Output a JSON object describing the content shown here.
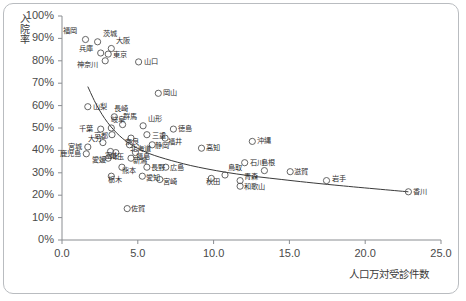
{
  "chart_data": {
    "type": "scatter",
    "title": "",
    "xlabel": "人口万対受診件数",
    "ylabel": "入院率",
    "xlim": [
      0,
      25
    ],
    "ylim": [
      0,
      1.0
    ],
    "xticks": [
      "0.0",
      "5.0",
      "10.0",
      "15.0",
      "20.0",
      "25.0"
    ],
    "xtick_values": [
      0,
      5,
      10,
      15,
      20,
      25
    ],
    "yticks": [
      "0%",
      "10%",
      "20%",
      "30%",
      "40%",
      "50%",
      "60%",
      "70%",
      "80%",
      "90%",
      "100%"
    ],
    "ytick_values": [
      0,
      10,
      20,
      30,
      40,
      50,
      60,
      70,
      80,
      90,
      100
    ],
    "grid": false,
    "legend": "none",
    "marker": "open-circle",
    "marker_color": "#555555",
    "trendline_color": "#3a3a3a",
    "points": [
      {
        "label": "福岡",
        "x": 1.55,
        "y": 89.5,
        "lx": -22,
        "ly": -9
      },
      {
        "label": "茨城",
        "x": 2.35,
        "y": 88.5,
        "lx": 5,
        "ly": -8
      },
      {
        "label": "大阪",
        "x": 3.25,
        "y": 85.5,
        "lx": 5,
        "ly": -7
      },
      {
        "label": "兵庫",
        "x": 2.55,
        "y": 83.5,
        "lx": -22,
        "ly": -4
      },
      {
        "label": "東京",
        "x": 3.05,
        "y": 83.0,
        "lx": 5,
        "ly": 1
      },
      {
        "label": "神奈川",
        "x": 2.85,
        "y": 80.0,
        "lx": -28,
        "ly": 4
      },
      {
        "label": "山口",
        "x": 5.05,
        "y": 79.5,
        "lx": 5,
        "ly": 0
      },
      {
        "label": "岡山",
        "x": 6.35,
        "y": 65.5,
        "lx": 5,
        "ly": 0
      },
      {
        "label": "山梨",
        "x": 1.7,
        "y": 59.5,
        "lx": 5,
        "ly": 0
      },
      {
        "label": "長崎",
        "x": 3.45,
        "y": 55.0,
        "lx": 0,
        "ly": -8
      },
      {
        "label": "群馬",
        "x": 4.0,
        "y": 51.5,
        "lx": 0,
        "ly": -8
      },
      {
        "label": "山形",
        "x": 5.35,
        "y": 51.0,
        "lx": 5,
        "ly": -7
      },
      {
        "label": "千葉",
        "x": 2.55,
        "y": 49.5,
        "lx": -22,
        "ly": 0
      },
      {
        "label": "岐阜",
        "x": 3.25,
        "y": 50.0,
        "lx": 0,
        "ly": -8
      },
      {
        "label": "徳島",
        "x": 7.35,
        "y": 49.5,
        "lx": 5,
        "ly": 0
      },
      {
        "label": "京都",
        "x": 3.3,
        "y": 47.0,
        "lx": -18,
        "ly": 1
      },
      {
        "label": "三重",
        "x": 5.6,
        "y": 47.0,
        "lx": 5,
        "ly": 1
      },
      {
        "label": "奈良",
        "x": 4.55,
        "y": 45.5,
        "lx": -6,
        "ly": 4
      },
      {
        "label": "福井",
        "x": 6.8,
        "y": 45.5,
        "lx": 3,
        "ly": 4
      },
      {
        "label": "大分",
        "x": 2.7,
        "y": 43.5,
        "lx": -15,
        "ly": -4
      },
      {
        "label": "北海道",
        "x": 4.45,
        "y": 42.5,
        "lx": 1,
        "ly": 4
      },
      {
        "label": "静岡",
        "x": 5.95,
        "y": 42.5,
        "lx": 3,
        "ly": 1
      },
      {
        "label": "宮城",
        "x": 1.7,
        "y": 41.5,
        "lx": -20,
        "ly": 0
      },
      {
        "label": "高知",
        "x": 9.2,
        "y": 41.0,
        "lx": 5,
        "ly": 0
      },
      {
        "label": "沖縄",
        "x": 12.55,
        "y": 44.0,
        "lx": 5,
        "ly": 0
      },
      {
        "label": "富山",
        "x": 3.2,
        "y": 39.5,
        "lx": -6,
        "ly": 4
      },
      {
        "label": "鹿児島",
        "x": 1.6,
        "y": 38.5,
        "lx": -26,
        "ly": 0
      },
      {
        "label": "埼玉",
        "x": 3.55,
        "y": 39.0,
        "lx": -6,
        "ly": 4
      },
      {
        "label": "福島",
        "x": 4.85,
        "y": 39.0,
        "lx": 0,
        "ly": 4
      },
      {
        "label": "愛媛",
        "x": 3.05,
        "y": 36.5,
        "lx": -16,
        "ly": 2
      },
      {
        "label": "新潟",
        "x": 4.55,
        "y": 36.5,
        "lx": 2,
        "ly": 3
      },
      {
        "label": "石川",
        "x": 12.05,
        "y": 34.5,
        "lx": 5,
        "ly": 0
      },
      {
        "label": "熊本",
        "x": 3.95,
        "y": 32.5,
        "lx": 0,
        "ly": 4
      },
      {
        "label": "長野",
        "x": 5.6,
        "y": 32.5,
        "lx": 4,
        "ly": 1
      },
      {
        "label": "広島",
        "x": 6.85,
        "y": 32.5,
        "lx": 4,
        "ly": 1
      },
      {
        "label": "栃木",
        "x": 3.25,
        "y": 28.5,
        "lx": -3,
        "ly": 4
      },
      {
        "label": "愛知",
        "x": 5.3,
        "y": 28.5,
        "lx": 4,
        "ly": 2
      },
      {
        "label": "宮崎",
        "x": 6.45,
        "y": 27.0,
        "lx": 3,
        "ly": 2
      },
      {
        "label": "秋田",
        "x": 9.85,
        "y": 27.5,
        "lx": -5,
        "ly": 4
      },
      {
        "label": "鳥取",
        "x": 10.75,
        "y": 29.0,
        "lx": 3,
        "ly": -7
      },
      {
        "label": "青森",
        "x": 11.75,
        "y": 26.5,
        "lx": 4,
        "ly": -4
      },
      {
        "label": "和歌山",
        "x": 11.75,
        "y": 24.0,
        "lx": 4,
        "ly": 1
      },
      {
        "label": "島根",
        "x": 13.35,
        "y": 31.0,
        "lx": -3,
        "ly": -8
      },
      {
        "label": "滋賀",
        "x": 15.05,
        "y": 30.5,
        "lx": 4,
        "ly": 0
      },
      {
        "label": "岩手",
        "x": 17.45,
        "y": 26.5,
        "lx": 5,
        "ly": -2
      },
      {
        "label": "香川",
        "x": 22.85,
        "y": 21.5,
        "lx": 5,
        "ly": 0
      },
      {
        "label": "佐賀",
        "x": 4.3,
        "y": 14.0,
        "lx": 4,
        "ly": 0
      }
    ],
    "trendline": [
      {
        "x": 1.7,
        "y": 68.5
      },
      {
        "x": 2.3,
        "y": 60.0
      },
      {
        "x": 3.0,
        "y": 52.5
      },
      {
        "x": 3.8,
        "y": 46.5
      },
      {
        "x": 4.7,
        "y": 42.0
      },
      {
        "x": 5.8,
        "y": 38.5
      },
      {
        "x": 7.2,
        "y": 35.5
      },
      {
        "x": 9.0,
        "y": 32.5
      },
      {
        "x": 11.5,
        "y": 29.5
      },
      {
        "x": 14.5,
        "y": 27.0
      },
      {
        "x": 18.0,
        "y": 24.5
      },
      {
        "x": 22.85,
        "y": 21.5
      }
    ]
  }
}
